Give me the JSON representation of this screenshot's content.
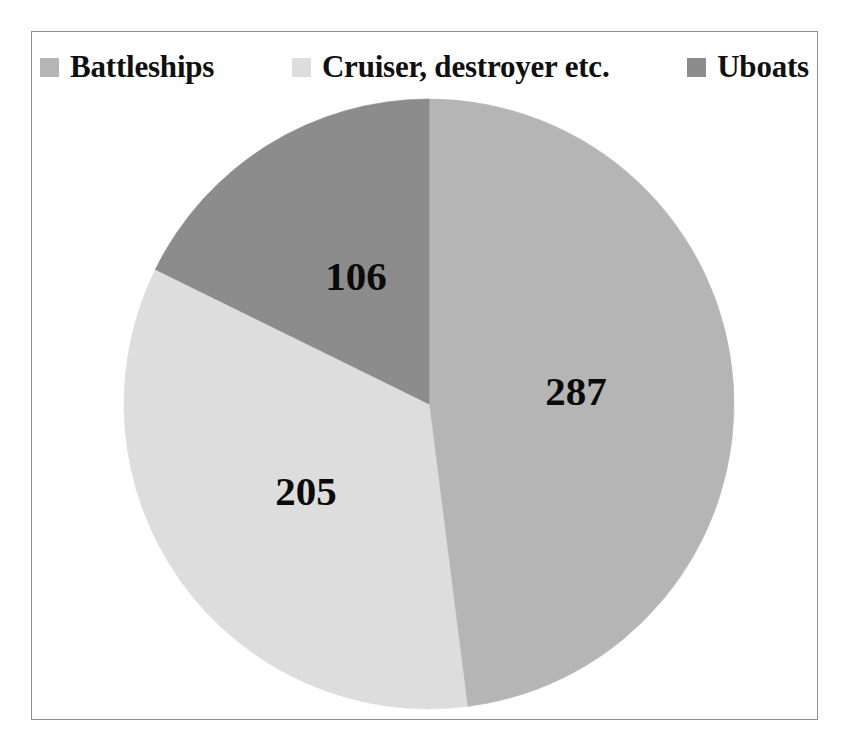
{
  "chart_data": {
    "type": "pie",
    "title": "",
    "categories": [
      "Battleships",
      "Cruiser, destroyer etc.",
      "Uboats"
    ],
    "values": [
      287,
      205,
      106
    ],
    "labels": [
      "287",
      "205",
      "106"
    ],
    "total": 598,
    "colors": [
      "#b5b5b5",
      "#dddddd",
      "#8c8c8c"
    ],
    "legend_position": "top",
    "grid": false,
    "start_angle_deg": 0,
    "direction": "clockwise",
    "slice_angles_deg": [
      172.8,
      123.4,
      63.8
    ]
  },
  "legend": {
    "items": [
      {
        "label": "Battleships",
        "color": "#b5b5b5",
        "swatch_name": "legend-swatch-battleships"
      },
      {
        "label": "Cruiser, destroyer etc.",
        "color": "#dddddd",
        "swatch_name": "legend-swatch-cruiser-destroyer"
      },
      {
        "label": "Uboats",
        "color": "#8c8c8c",
        "swatch_name": "legend-swatch-uboats"
      }
    ]
  },
  "frame": {
    "border_color": "#8f8f8f",
    "background": "#ffffff"
  },
  "slices": [
    {
      "label": "287",
      "name": "pie-slice-battleships",
      "color": "#b5b5b5",
      "label_x": 575,
      "label_y": 390
    },
    {
      "label": "205",
      "name": "pie-slice-cruiser-destroyer",
      "color": "#dddddd",
      "label_x": 305,
      "label_y": 490
    },
    {
      "label": "106",
      "name": "pie-slice-uboats",
      "color": "#8c8c8c",
      "label_x": 355,
      "label_y": 275
    }
  ]
}
